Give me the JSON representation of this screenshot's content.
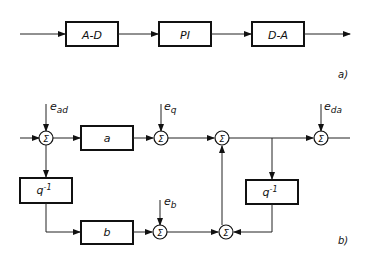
{
  "diagram_a": {
    "label": "a)",
    "blocks": [
      {
        "id": "ad",
        "label": "A-D"
      },
      {
        "id": "pi",
        "label": "PI"
      },
      {
        "id": "da",
        "label": "D-A"
      }
    ]
  },
  "diagram_b": {
    "label": "b)",
    "blocks": {
      "a": "a",
      "b": "b",
      "delay_left": "q",
      "delay_right": "q",
      "delay_exp": "-1"
    },
    "sum_symbol": "Σ",
    "inputs": {
      "ead": {
        "base": "e",
        "sub": "ad"
      },
      "eq": {
        "base": "e",
        "sub": "q"
      },
      "eb": {
        "base": "e",
        "sub": "b"
      },
      "eda": {
        "base": "e",
        "sub": "da"
      }
    }
  }
}
